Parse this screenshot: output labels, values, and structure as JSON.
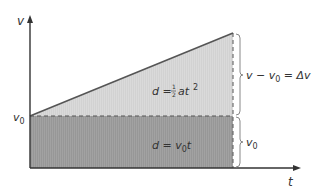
{
  "diagram": {
    "axes": {
      "y_label": "v",
      "x_label": "t",
      "y_tick_label_base": "v",
      "y_tick_label_sub": "0"
    },
    "regions": {
      "triangle": {
        "label_prefix": "d = ",
        "frac_num": "1",
        "frac_den": "2",
        "label_suffix": "at",
        "exponent": "2",
        "color": "#d4d4d4"
      },
      "rectangle": {
        "label_prefix": "d = v",
        "label_sub": "0",
        "label_suffix": "t",
        "color": "#9a9a9a"
      }
    },
    "braces": {
      "upper": {
        "text_a": "v − v",
        "text_sub": "0",
        "text_b": " = Δv"
      },
      "lower": {
        "text_base": "v",
        "text_sub": "0"
      }
    },
    "colors": {
      "axis": "#333333",
      "line": "#555555",
      "dash": "#555555",
      "brace": "#888888"
    }
  }
}
